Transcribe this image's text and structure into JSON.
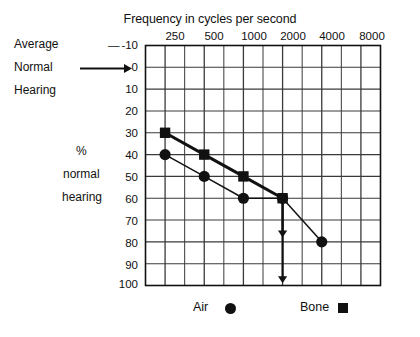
{
  "chart_data": {
    "type": "line",
    "title": "Frequency in cycles per second",
    "xlabel": "Frequency in cycles per second",
    "ylabel": "% normal hearing",
    "x_tick_labels": [
      "250",
      "500",
      "1000",
      "2000",
      "4000",
      "8000"
    ],
    "x_axis_position": "top",
    "y_tick_labels": [
      "-10",
      "0",
      "10",
      "20",
      "30",
      "40",
      "50",
      "60",
      "70",
      "80",
      "90",
      "100"
    ],
    "ylim": [
      -10,
      100
    ],
    "y_inverted": true,
    "grid": true,
    "grid_columns": 12,
    "grid_rows": 11,
    "legend_position": "bottom",
    "series": [
      {
        "name": "Air",
        "marker": "circle",
        "x": [
          "250",
          "500",
          "1000",
          "2000",
          "4000"
        ],
        "values": [
          40,
          50,
          60,
          60,
          80
        ]
      },
      {
        "name": "Bone",
        "marker": "square",
        "x": [
          "250",
          "500",
          "1000",
          "2000"
        ],
        "values": [
          30,
          40,
          50,
          60
        ]
      }
    ],
    "annotations": [
      {
        "type": "arrow",
        "label": "no-response-arrow-short",
        "x": "2000",
        "y_from": 60,
        "y_to": 78
      },
      {
        "type": "arrow",
        "label": "no-response-arrow-long",
        "x": "2000",
        "y_from": 60,
        "y_to": 99
      },
      {
        "type": "arrow",
        "label": "average-normal-hearing-pointer",
        "target_y": 0
      }
    ]
  },
  "left_notes": {
    "line1": "Average",
    "line2": "Normal",
    "line3": "Hearing"
  },
  "y_caption": {
    "line1": "%",
    "line2": "normal",
    "line3": "hearing"
  },
  "legend": {
    "air_label": "Air",
    "bone_label": "Bone"
  },
  "colors": {
    "ink": "#111111",
    "grid": "#3a3a3a",
    "background": "#ffffff"
  }
}
